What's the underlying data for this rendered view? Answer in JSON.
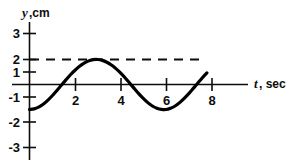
{
  "chart_data": {
    "type": "line",
    "title": "",
    "subtitle": "",
    "xlabel_symbol": "t",
    "xlabel_unit": ", sec",
    "ylabel_symbol": "y",
    "ylabel_unit": ",cm",
    "xlim": [
      0,
      8.4
    ],
    "ylim": [
      -3.4,
      3.4
    ],
    "grid": false,
    "legend": null,
    "xticks": [
      2,
      4,
      6,
      8
    ],
    "xtick_labels": [
      "2",
      "4",
      "6",
      "8"
    ],
    "yticks": [
      3,
      2,
      1,
      -1,
      -2,
      -3
    ],
    "ytick_labels": [
      "3",
      "2",
      "1",
      "-1",
      "-2",
      "-3"
    ],
    "series": [
      {
        "name": "displacement",
        "equation": "y = -2 cos(pi t / 2)",
        "amplitude": 2,
        "period": 4,
        "color": "#000000",
        "x": [
          0,
          0.2,
          0.4,
          0.6,
          0.8,
          1,
          1.2,
          1.4,
          1.6,
          1.8,
          2,
          2.2,
          2.4,
          2.6,
          2.8,
          3,
          3.2,
          3.4,
          3.6,
          3.8,
          4,
          4.2,
          4.4,
          4.6,
          4.8,
          5,
          5.2,
          5.4,
          5.6,
          5.8,
          6,
          6.2,
          6.4,
          6.6,
          6.8,
          7,
          7.2,
          7.4,
          7.6,
          7.8
        ],
        "y": [
          -2,
          -1.95,
          -1.81,
          -1.58,
          -1.27,
          -0.9,
          -0.49,
          -0.06,
          0.37,
          0.78,
          1.14,
          1.46,
          1.71,
          1.89,
          1.99,
          2,
          1.93,
          1.78,
          1.56,
          1.27,
          0.93,
          0.54,
          0.12,
          -0.31,
          -0.73,
          -1.11,
          -1.45,
          -1.72,
          -1.9,
          -1.99,
          -2,
          -1.9,
          -1.72,
          -1.45,
          -1.11,
          -0.73,
          -0.31,
          0.12,
          0.54,
          0.93
        ]
      }
    ],
    "annotations": [
      {
        "name": "amplitude-guide",
        "type": "horizontal-dashed-line",
        "y": 2,
        "x_start": 0,
        "x_end": 7.6,
        "style": "dashed"
      }
    ]
  }
}
